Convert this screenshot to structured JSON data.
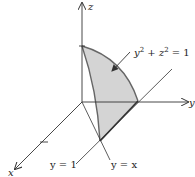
{
  "diagram": {
    "axes": {
      "x_label": "x",
      "y_label": "y",
      "z_label": "z"
    },
    "surface_label": {
      "base": "y",
      "exp1": "2",
      "plus": " + ",
      "base2": "z",
      "exp2": "2",
      "rhs": " = 1"
    },
    "plane_labels": {
      "y_eq_1": "y = 1",
      "y_eq_x": "y = x"
    },
    "colors": {
      "region_fill": "#d4d4d4",
      "edge": "#555555",
      "axis": "#333333"
    }
  }
}
